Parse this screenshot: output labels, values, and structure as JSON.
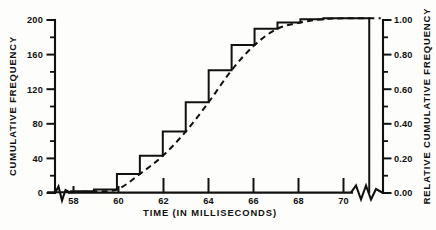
{
  "figure": {
    "style": "scanned black-and-white statistical figure",
    "background_color": "#fdfdfb",
    "ink_color": "#111111"
  },
  "axes": {
    "x": {
      "title": "TIME (IN MILLISECONDS)",
      "tick_labels": [
        "58",
        "60",
        "62",
        "64",
        "66",
        "68",
        "70"
      ],
      "tick_values": [
        58,
        60,
        62,
        64,
        66,
        68,
        70
      ],
      "minor_tick_values": [
        59,
        61,
        63,
        65,
        67,
        69,
        71
      ],
      "range": [
        57.3,
        71.6
      ],
      "has_break_symbols": true
    },
    "y_left": {
      "title": "CUMULATIVE FREQUENCY",
      "tick_labels": [
        "0",
        "40",
        "80",
        "120",
        "160",
        "200"
      ],
      "tick_values": [
        0,
        40,
        80,
        120,
        160,
        200
      ],
      "minor_tick_values": [
        20,
        60,
        100,
        140,
        180
      ],
      "range": [
        0,
        200
      ]
    },
    "y_right": {
      "title": "RELATIVE CUMULATIVE FREQUENCY",
      "tick_labels": [
        "0.00",
        "0.20",
        "0.40",
        "0.60",
        "0.80",
        "1.00"
      ],
      "tick_values": [
        0.0,
        0.2,
        0.4,
        0.6,
        0.8,
        1.0
      ],
      "minor_tick_values": [
        0.1,
        0.3,
        0.5,
        0.7,
        0.9
      ],
      "range": [
        0,
        1
      ]
    }
  },
  "chart_data": {
    "type": "bar",
    "title": "",
    "subtitle": "",
    "xlabel": "TIME (IN MILLISECONDS)",
    "ylabel": "CUMULATIVE FREQUENCY",
    "y2label": "RELATIVE CUMULATIVE FREQUENCY",
    "xlim": [
      57.3,
      71.6
    ],
    "ylim": [
      0,
      200
    ],
    "y2lim": [
      0,
      1
    ],
    "grid": false,
    "legend": false,
    "bin_width": 1,
    "bin_upper_edges": [
      58,
      59,
      60,
      61,
      62,
      63,
      64,
      65,
      66,
      67,
      68,
      69,
      70,
      71
    ],
    "categories": [
      "58",
      "59",
      "60",
      "61",
      "62",
      "63",
      "64",
      "65",
      "66",
      "67",
      "68",
      "69",
      "70",
      "71"
    ],
    "values": [
      1,
      2,
      4,
      22,
      43,
      71,
      105,
      142,
      171,
      190,
      197,
      201,
      202,
      202
    ],
    "series": [
      {
        "name": "Cumulative frequency (step histogram)",
        "style": "step",
        "values": [
          1,
          2,
          4,
          22,
          43,
          71,
          105,
          142,
          171,
          190,
          197,
          201,
          202,
          202
        ]
      },
      {
        "name": "Smoothed ogive (dashed curve)",
        "style": "dashed-line",
        "x": [
          58,
          59,
          60,
          61,
          62,
          63,
          64,
          65,
          66,
          67,
          68,
          69,
          70,
          71,
          71.5
        ],
        "values": [
          1,
          2,
          4,
          22,
          43,
          71,
          105,
          142,
          171,
          190,
          197,
          201,
          202,
          202,
          202
        ]
      }
    ],
    "relative_values": [
      0.005,
      0.01,
      0.02,
      0.109,
      0.213,
      0.351,
      0.52,
      0.703,
      0.847,
      0.941,
      0.975,
      0.995,
      1.0,
      1.0
    ],
    "annotations": [
      {
        "name": "x-axis-break-left",
        "text": ""
      },
      {
        "name": "x-axis-break-right",
        "text": ""
      }
    ]
  }
}
